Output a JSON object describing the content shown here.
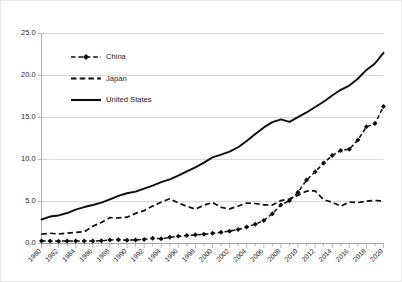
{
  "chart_data": {
    "type": "line",
    "title": "",
    "subtitle": "",
    "xlabel": "",
    "ylabel": "",
    "xlim": [
      1980,
      2020
    ],
    "ylim": [
      0.0,
      25.0
    ],
    "grid": true,
    "legend_position": "upper-left-inside",
    "y_ticks": [
      "0.0",
      "5.0",
      "10.0",
      "15.0",
      "20.0",
      "25.0"
    ],
    "y_tick_values": [
      0,
      5,
      10,
      15,
      20,
      25
    ],
    "x_ticks": [
      "1980",
      "1982",
      "1984",
      "1986",
      "1988",
      "1990",
      "1992",
      "1994",
      "1996",
      "1998",
      "2000",
      "2002",
      "2004",
      "2006",
      "2008",
      "2010",
      "2012",
      "2014",
      "2016",
      "2018",
      "2020"
    ],
    "x_tick_values": [
      1980,
      1982,
      1984,
      1986,
      1988,
      1990,
      1992,
      1994,
      1996,
      1998,
      2000,
      2002,
      2004,
      2006,
      2008,
      2010,
      2012,
      2014,
      2016,
      2018,
      2020
    ],
    "x_minor_tick_values": [
      1980,
      1981,
      1982,
      1983,
      1984,
      1985,
      1986,
      1987,
      1988,
      1989,
      1990,
      1991,
      1992,
      1993,
      1994,
      1995,
      1996,
      1997,
      1998,
      1999,
      2000,
      2001,
      2002,
      2003,
      2004,
      2005,
      2006,
      2007,
      2008,
      2009,
      2010,
      2011,
      2012,
      2013,
      2014,
      2015,
      2016,
      2017,
      2018,
      2019,
      2020
    ],
    "x": [
      1980,
      1981,
      1982,
      1983,
      1984,
      1985,
      1986,
      1987,
      1988,
      1989,
      1990,
      1991,
      1992,
      1993,
      1994,
      1995,
      1996,
      1997,
      1998,
      1999,
      2000,
      2001,
      2002,
      2003,
      2004,
      2005,
      2006,
      2007,
      2008,
      2009,
      2010,
      2011,
      2012,
      2013,
      2014,
      2015,
      2016,
      2017,
      2018,
      2019,
      2020
    ],
    "series": [
      {
        "name": "China",
        "style": "dashed-with-markers",
        "marker": "diamond",
        "color": "#0d0d0d",
        "values": [
          0.3,
          0.29,
          0.28,
          0.3,
          0.31,
          0.31,
          0.3,
          0.33,
          0.41,
          0.46,
          0.4,
          0.42,
          0.49,
          0.62,
          0.56,
          0.73,
          0.86,
          0.96,
          1.03,
          1.09,
          1.21,
          1.34,
          1.47,
          1.66,
          1.96,
          2.29,
          2.75,
          3.55,
          4.59,
          5.1,
          6.09,
          7.55,
          8.53,
          9.57,
          10.48,
          11.06,
          11.23,
          12.31,
          13.89,
          14.28,
          16.3
        ]
      },
      {
        "name": "Japan",
        "style": "dashed",
        "marker": "none",
        "color": "#0d0d0d",
        "values": [
          1.11,
          1.22,
          1.13,
          1.24,
          1.32,
          1.4,
          2.05,
          2.51,
          3.07,
          3.05,
          3.13,
          3.58,
          3.91,
          4.45,
          4.91,
          5.33,
          4.83,
          4.42,
          4.1,
          4.56,
          4.89,
          4.3,
          4.12,
          4.44,
          4.82,
          4.76,
          4.6,
          4.58,
          5.11,
          5.29,
          5.76,
          6.23,
          6.27,
          5.21,
          4.9,
          4.44,
          4.93,
          4.87,
          5.04,
          5.12,
          5.06
        ]
      },
      {
        "name": "United States",
        "style": "solid",
        "marker": "none",
        "color": "#0d0d0d",
        "values": [
          2.86,
          3.21,
          3.34,
          3.63,
          4.04,
          4.34,
          4.58,
          4.86,
          5.25,
          5.66,
          5.98,
          6.17,
          6.54,
          6.88,
          7.31,
          7.64,
          8.07,
          8.58,
          9.06,
          9.63,
          10.25,
          10.58,
          10.94,
          11.46,
          12.21,
          13.04,
          13.82,
          14.45,
          14.77,
          14.48,
          15.05,
          15.6,
          16.25,
          16.88,
          17.61,
          18.3,
          18.8,
          19.61,
          20.66,
          21.43,
          22.7
        ]
      }
    ]
  },
  "legend": {
    "entries": [
      {
        "label": "China"
      },
      {
        "label": "Japan"
      },
      {
        "label": "United States"
      }
    ]
  }
}
